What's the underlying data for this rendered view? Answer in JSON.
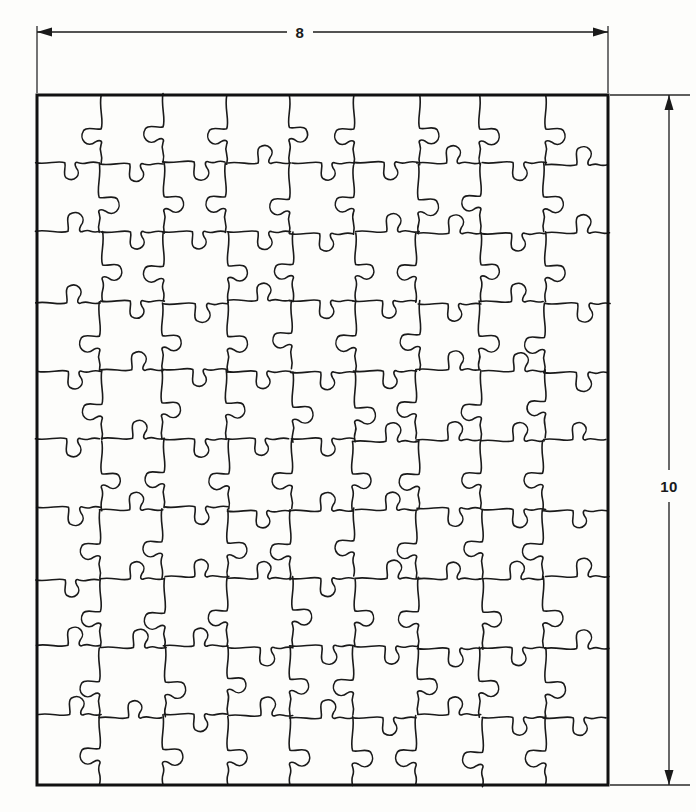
{
  "drawing": {
    "title": "Jigsaw puzzle cutting pattern",
    "background_color": "#fdfdfb",
    "line_color": "#1a1a1a",
    "border": {
      "x": 37,
      "y": 95,
      "width": 571,
      "height": 690,
      "stroke_width": 3
    }
  },
  "dimensions": {
    "width": {
      "label": "8",
      "orientation": "horizontal",
      "position": "top",
      "line_y": 32,
      "from_x": 37,
      "to_x": 608,
      "label_x": 300,
      "label_y": 32
    },
    "height": {
      "label": "10",
      "orientation": "vertical",
      "position": "right",
      "line_x": 669,
      "from_y": 95,
      "to_y": 785,
      "label_x": 669,
      "label_y": 486
    }
  },
  "puzzle": {
    "columns": 9,
    "rows": 10,
    "piece_count": 90,
    "stroke_width": 1.6,
    "style": "interlocking-tabs"
  },
  "chart_data": {
    "type": "table",
    "categories": [
      "width",
      "height",
      "columns",
      "rows",
      "pieces"
    ],
    "values": [
      8,
      10,
      9,
      10,
      90
    ],
    "xlabel": "8",
    "ylabel": "10",
    "annotations": [
      "8",
      "10"
    ]
  }
}
